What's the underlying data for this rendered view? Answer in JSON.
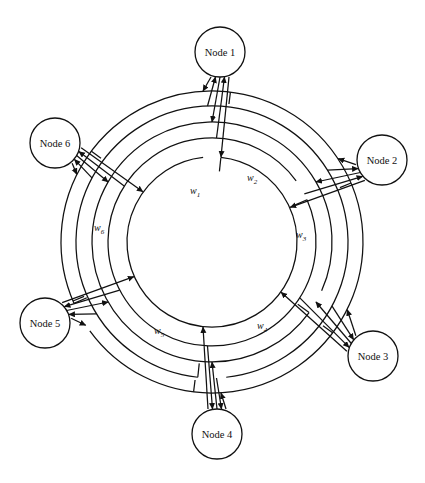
{
  "diagram": {
    "type": "node-ring-diagram",
    "colors": {
      "stroke": "#111111",
      "background": "#ffffff",
      "node_fill": "#ffffff"
    },
    "geometry": {
      "center": {
        "x": 212,
        "y": 242
      },
      "ring_radii": [
        85,
        104,
        120,
        136,
        151
      ],
      "node_radius": 25
    },
    "nodes": [
      {
        "id": "node-1",
        "label": "Node 1",
        "angle_deg": -90,
        "cx": 220,
        "cy": 52,
        "r": 25
      },
      {
        "id": "node-2",
        "label": "Node 2",
        "angle_deg": -30,
        "cx": 382,
        "cy": 160,
        "r": 25
      },
      {
        "id": "node-3",
        "label": "Node 3",
        "angle_deg": 30,
        "cx": 373,
        "cy": 356,
        "r": 25
      },
      {
        "id": "node-4",
        "label": "Node 4",
        "angle_deg": 90,
        "cx": 217,
        "cy": 434,
        "r": 25
      },
      {
        "id": "node-5",
        "label": "Node 5",
        "angle_deg": 150,
        "cx": 45,
        "cy": 323,
        "r": 25
      },
      {
        "id": "node-6",
        "label": "Node 6",
        "angle_deg": -150,
        "cx": 55,
        "cy": 143,
        "r": 25
      }
    ],
    "weights": [
      {
        "id": "w1",
        "label": "w",
        "subscript": "1",
        "x": 190,
        "y": 194
      },
      {
        "id": "w2",
        "label": "w",
        "subscript": "2",
        "x": 247,
        "y": 181
      },
      {
        "id": "w3",
        "label": "w",
        "subscript": "3",
        "x": 296,
        "y": 238
      },
      {
        "id": "w4",
        "label": "w",
        "subscript": "4",
        "x": 257,
        "y": 329
      },
      {
        "id": "w5",
        "label": "w",
        "subscript": "5",
        "x": 154,
        "y": 334
      },
      {
        "id": "w6",
        "label": "w",
        "subscript": "6",
        "x": 94,
        "y": 231
      }
    ]
  }
}
